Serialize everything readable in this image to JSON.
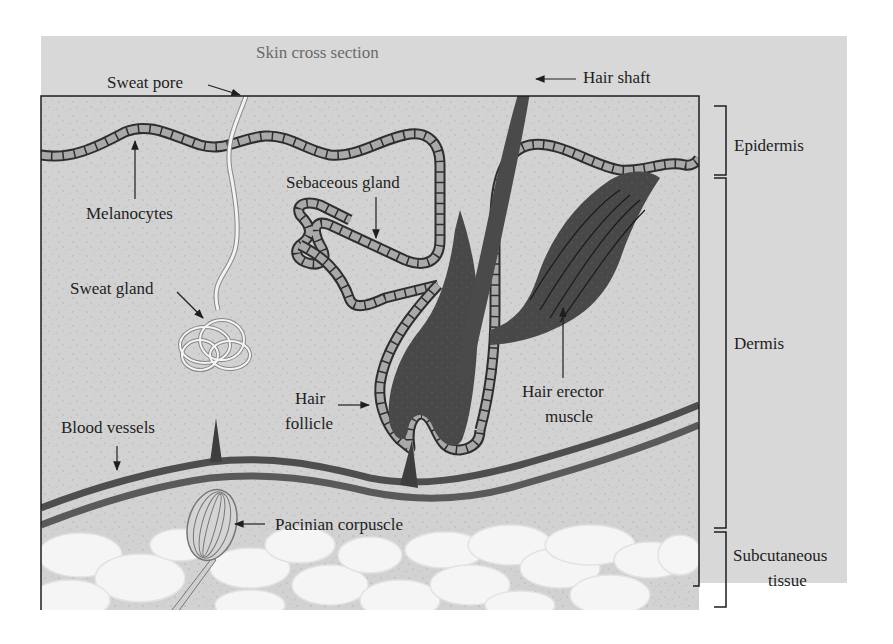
{
  "title": "Skin cross section",
  "labels": {
    "sweat_pore": "Sweat pore",
    "hair_shaft": "Hair shaft",
    "melanocytes": "Melanocytes",
    "sebaceous_gland": "Sebaceous gland",
    "sweat_gland": "Sweat gland",
    "hair_follicle_line1": "Hair",
    "hair_follicle_line2": "follicle",
    "hair_erector_line1": "Hair erector",
    "hair_erector_line2": "muscle",
    "blood_vessels": "Blood vessels",
    "pacinian_corpuscle": "Pacinian corpuscle"
  },
  "layers": {
    "epidermis": "Epidermis",
    "dermis": "Dermis",
    "subcutaneous_line1": "Subcutaneous",
    "subcutaneous_line2": "tissue"
  },
  "colors": {
    "background_panel": "#d6d6d6",
    "tissue": "#cfcfcf",
    "cell_fill": "#a9a9a9",
    "dark_structure": "#4a4a4a",
    "vessel": "#555555",
    "fat_cells": "#f4f4f4",
    "text": "#1e1e1e"
  }
}
